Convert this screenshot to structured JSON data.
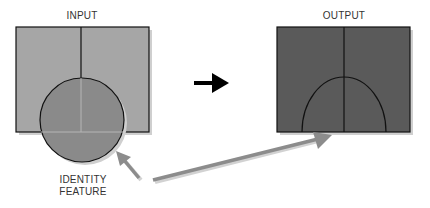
{
  "diagram": {
    "input_label": "INPUT",
    "output_label": "OUTPUT",
    "feature_label_line1": "IDENTITY",
    "feature_label_line2": "FEATURE",
    "colors": {
      "input_fill": "#a6a6a6",
      "input_circle_fill": "#8a8a8a",
      "output_fill": "#5a5a5a",
      "stroke": "#111111",
      "arrow_gray": "#8c8c8c",
      "arrow_black": "#000000",
      "shadow": "#cfcfcf"
    }
  }
}
